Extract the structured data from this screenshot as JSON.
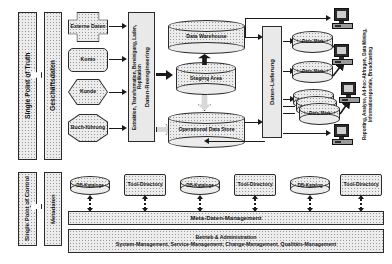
{
  "diagram": {
    "columns": {
      "single_point_of_truth": "Single Point of Truth",
      "geschaeftsdaten": "Geschäftsdaten",
      "single_point_of_control": "Single Point of Control",
      "metadaten": "Metadaten"
    },
    "sources": [
      {
        "label": "Externe Daten",
        "shape": "cross"
      },
      {
        "label": "Konto",
        "shape": "rounded-rect"
      },
      {
        "label": "Kunde",
        "shape": "hexagon"
      },
      {
        "label": "Buch-führung",
        "shape": "octagon"
      }
    ],
    "process_bars": {
      "reengineering_title": "Daten-Reengineering",
      "reengineering_detail": "Extraktion, Transformation, Bereinigung, Laden, Replikation",
      "lieferung": "Daten-Lieferung"
    },
    "stores": [
      {
        "label": "Data Warehouse"
      },
      {
        "label": "Staging Area"
      },
      {
        "label": "Operational Data Store"
      }
    ],
    "data_marts": [
      {
        "label": "Data-Mart"
      },
      {
        "label": "Data-Mart"
      },
      {
        "label": "Data-Mart"
      }
    ],
    "consumers_label": "Reporting, Analyse, Ad-hoc-Abfragen, Data Mining, Informationsportale, Broadcasting",
    "workstations": [
      {
        "name": "workstation-1"
      },
      {
        "name": "workstation-2"
      },
      {
        "name": "workstation-3"
      },
      {
        "name": "workstation-4"
      }
    ],
    "metadata_nodes": [
      {
        "label": "DB-Kataloge",
        "shape": "cylinder"
      },
      {
        "label": "Tool-Directory",
        "shape": "rect"
      },
      {
        "label": "DB-Kataloge",
        "shape": "cylinder"
      },
      {
        "label": "Tool-Directory",
        "shape": "rect"
      },
      {
        "label": "DB-Katalog",
        "shape": "cylinder"
      },
      {
        "label": "Tool-Directory",
        "shape": "rect"
      }
    ],
    "bottom_bars": {
      "meta_management": "Meta-Daten-Management",
      "operations_title": "Betrieb & Administration",
      "operations_detail": "System-Management, Service-Management, Change-Management, Qualitäts-Management"
    },
    "colors": {
      "fill": "#ececec",
      "stroke": "#2b2b2b",
      "arrow": "#1a1a1a",
      "hollow_arrow": "#d8d8d8"
    }
  }
}
